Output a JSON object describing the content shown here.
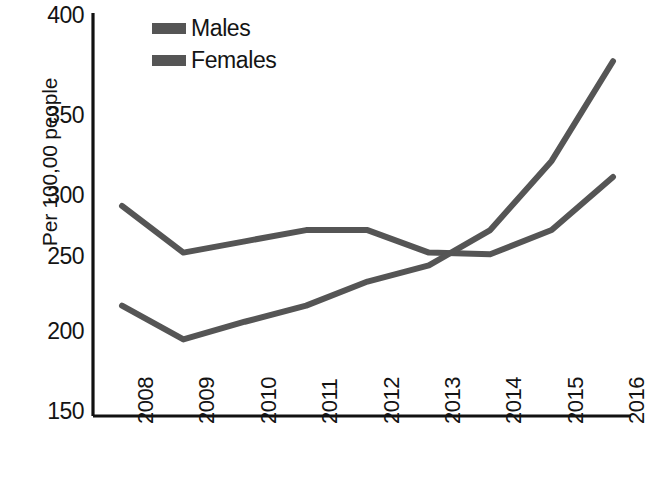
{
  "chart_data": {
    "type": "line",
    "title": "",
    "xlabel": "",
    "ylabel": "Per 100,00 people",
    "categories": [
      "2008",
      "2009",
      "2010",
      "2011",
      "2012",
      "2013",
      "2014",
      "2015",
      "2016"
    ],
    "x": [
      2008,
      2009,
      2010,
      2011,
      2012,
      2013,
      2014,
      2015,
      2016
    ],
    "series": [
      {
        "name": "Males",
        "color": "#555555",
        "values": [
          280,
          251,
          258,
          265,
          265,
          251,
          250,
          265,
          298
        ]
      },
      {
        "name": "Females",
        "color": "#555555",
        "values": [
          218,
          197,
          208,
          218,
          233,
          243,
          265,
          308,
          370
        ]
      }
    ],
    "ylim": [
      150,
      400
    ],
    "yticks": [
      150,
      200,
      250,
      300,
      350,
      400
    ],
    "ytick_labels": [
      "150",
      "200",
      "250",
      "300",
      "350",
      "400"
    ],
    "grid": false,
    "legend_position": "top-left-inside",
    "xtick_rotation": -90
  },
  "legend": {
    "items": [
      {
        "label": "Males",
        "swatch_color": "#555555"
      },
      {
        "label": "Females",
        "swatch_color": "#555555"
      }
    ]
  },
  "axes": {
    "y_title": "Per 100,00 people",
    "y_labels": [
      "400",
      "350",
      "300",
      "250",
      "200",
      "150"
    ],
    "x_labels": [
      "2008",
      "2009",
      "2010",
      "2011",
      "2012",
      "2013",
      "2014",
      "2015",
      "2016"
    ]
  },
  "colors": {
    "line": "#555555",
    "axis": "#111111",
    "text": "#141414",
    "background": "#ffffff"
  }
}
